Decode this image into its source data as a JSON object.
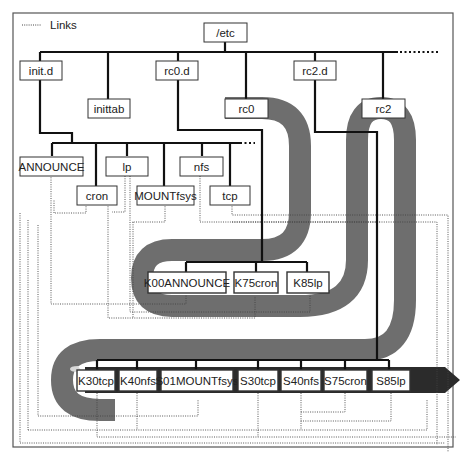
{
  "legend": {
    "label": "Links",
    "line_style": "dotted"
  },
  "colors": {
    "band": "#6e6e6e",
    "band_light": "#d8d8d8",
    "arrow": "#2b2b2b",
    "tree_line": "#111111",
    "box_border": "#333333",
    "box_fill": "#ffffff",
    "frame": "#555555"
  },
  "nodes": {
    "etc": "/etc",
    "init_d": "init.d",
    "inittab": "inittab",
    "rc0_d": "rc0.d",
    "rc0": "rc0",
    "rc2_d": "rc2.d",
    "rc2": "rc2",
    "announce": "ANNOUNCE",
    "cron": "cron",
    "lp": "lp",
    "mountfsys": "MOUNTfsys",
    "nfs": "nfs",
    "tcp": "tcp",
    "k00announce": "K00ANNOUNCE",
    "k75cron": "K75cron",
    "k85lp": "K85lp",
    "k30tcp": "K30tcp",
    "k40nfs": "K40nfs",
    "s01mountfsys": "S01MOUNTfsys",
    "s30tcp": "S30tcp",
    "s40nfs": "S40nfs",
    "s75cron": "S75cron",
    "s85lp": "S85lp"
  }
}
